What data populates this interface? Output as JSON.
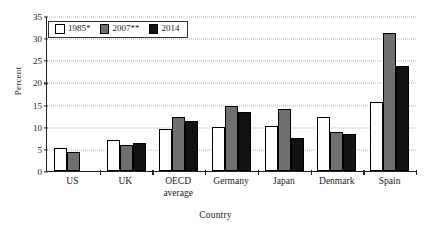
{
  "chart_data": {
    "type": "bar",
    "title": "",
    "subtitle": "",
    "xlabel": "Country",
    "ylabel": "Percent",
    "ylim": [
      0,
      35
    ],
    "yticks": [
      0,
      5,
      10,
      15,
      20,
      25,
      30,
      35
    ],
    "grid": "horizontal-dotted",
    "legend_position": "top-left-inside",
    "categories": [
      "US",
      "UK",
      "OECD average",
      "Germany",
      "Japan",
      "Denmark",
      "Spain"
    ],
    "category_lines": [
      [
        "US"
      ],
      [
        "UK"
      ],
      [
        "OECD",
        "average"
      ],
      [
        "Germany"
      ],
      [
        "Japan"
      ],
      [
        "Denmark"
      ],
      [
        "Spain"
      ]
    ],
    "series": [
      {
        "name": "1985*",
        "color": "#ffffff",
        "values": [
          5.2,
          7.0,
          9.4,
          10.0,
          10.2,
          12.3,
          15.5
        ]
      },
      {
        "name": "2007**",
        "color": "#6f6f6f",
        "values": [
          4.2,
          5.8,
          12.3,
          14.7,
          14.0,
          8.8,
          31.2
        ]
      },
      {
        "name": "2014",
        "color": "#111111",
        "values": [
          null,
          6.4,
          11.2,
          13.3,
          7.5,
          8.4,
          23.8
        ]
      }
    ]
  },
  "legend": {
    "items": [
      {
        "label": "1985*"
      },
      {
        "label": "2007**"
      },
      {
        "label": "2014"
      }
    ]
  },
  "axes": {
    "y_title": "Percent",
    "x_title": "Country",
    "y_tick_labels": [
      "0",
      "5",
      "10",
      "15",
      "20",
      "25",
      "30",
      "35"
    ]
  }
}
